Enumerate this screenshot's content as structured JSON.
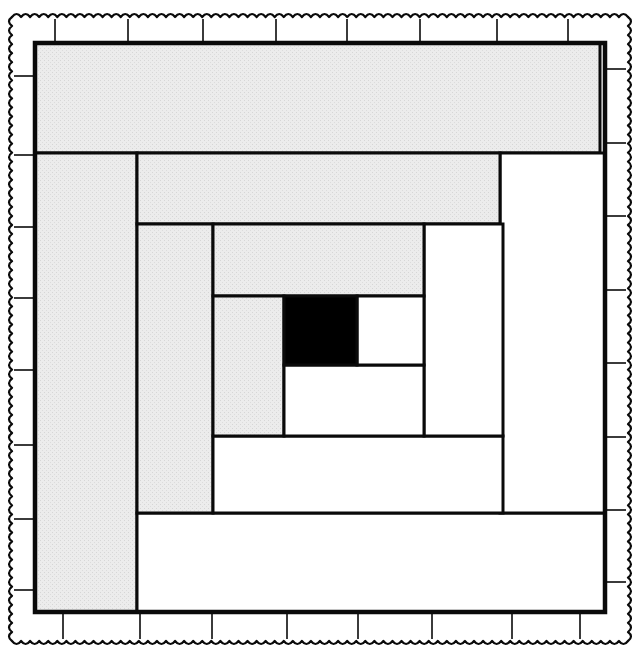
{
  "diagram": {
    "title": "Log Cabin quilt block",
    "type": "quilt-block",
    "colors": {
      "shaded": "#ebebeb",
      "light": "#ffffff",
      "center": "#000000",
      "line": "#0a0a0a"
    },
    "outer_frame": {
      "x": 35,
      "y": 43,
      "w": 570,
      "h": 569
    },
    "pieces": [
      {
        "id": "log-1-top",
        "tone": "shaded",
        "x": 35,
        "y": 43,
        "w": 565,
        "h": 110
      },
      {
        "id": "log-2-left",
        "tone": "shaded",
        "x": 35,
        "y": 153,
        "w": 102,
        "h": 459
      },
      {
        "id": "log-3-bottom",
        "tone": "light",
        "x": 137,
        "y": 513,
        "w": 468,
        "h": 99
      },
      {
        "id": "log-4-right",
        "tone": "light",
        "x": 500,
        "y": 153,
        "w": 105,
        "h": 360
      },
      {
        "id": "log-5-top",
        "tone": "shaded",
        "x": 137,
        "y": 153,
        "w": 363,
        "h": 71
      },
      {
        "id": "log-6-left",
        "tone": "shaded",
        "x": 137,
        "y": 224,
        "w": 76,
        "h": 289
      },
      {
        "id": "log-7-bottom",
        "tone": "light",
        "x": 213,
        "y": 436,
        "w": 290,
        "h": 77
      },
      {
        "id": "log-8-right",
        "tone": "light",
        "x": 424,
        "y": 224,
        "w": 79,
        "h": 212
      },
      {
        "id": "log-9-top",
        "tone": "shaded",
        "x": 213,
        "y": 224,
        "w": 211,
        "h": 72
      },
      {
        "id": "log-10-left",
        "tone": "shaded",
        "x": 213,
        "y": 296,
        "w": 71,
        "h": 140
      },
      {
        "id": "log-11-bottom",
        "tone": "light",
        "x": 284,
        "y": 365,
        "w": 140,
        "h": 71
      },
      {
        "id": "log-12-right",
        "tone": "light",
        "x": 357,
        "y": 296,
        "w": 67,
        "h": 69
      },
      {
        "id": "center-square",
        "tone": "center",
        "x": 284,
        "y": 296,
        "w": 73,
        "h": 69
      }
    ],
    "border": {
      "outer": {
        "x": 12,
        "y": 17,
        "w": 616,
        "h": 624
      },
      "top_ticks_x": [
        55,
        128,
        203,
        276,
        347,
        420,
        497,
        568
      ],
      "bottom_ticks_x": [
        63,
        140,
        212,
        287,
        358,
        432,
        512,
        580
      ],
      "left_ticks_y": [
        76,
        155,
        227,
        298,
        370,
        445,
        519,
        590
      ],
      "right_ticks_y": [
        69,
        143,
        216,
        290,
        363,
        437,
        510,
        582
      ]
    }
  }
}
